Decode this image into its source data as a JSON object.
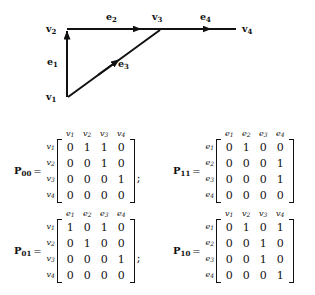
{
  "figure": {
    "name": "directed-graph",
    "nodes": [
      {
        "id": "v1",
        "label": "v",
        "sub": "1"
      },
      {
        "id": "v2",
        "label": "v",
        "sub": "2"
      },
      {
        "id": "v3",
        "label": "v",
        "sub": "3"
      },
      {
        "id": "v4",
        "label": "v",
        "sub": "4"
      }
    ],
    "edges": [
      {
        "id": "e1",
        "label": "e",
        "sub": "1",
        "from": "v1",
        "to": "v2"
      },
      {
        "id": "e2",
        "label": "e",
        "sub": "2",
        "from": "v2",
        "to": "v3"
      },
      {
        "id": "e3",
        "label": "e",
        "sub": "3",
        "from": "v1",
        "to": "v3"
      },
      {
        "id": "e4",
        "label": "e",
        "sub": "4",
        "from": "v3",
        "to": "v4"
      }
    ]
  },
  "matrices": [
    {
      "key": "P00",
      "name": "P",
      "sub": "00",
      "equals": "=",
      "trailing": ";",
      "col_headers": [
        {
          "base": "v",
          "sub": "1"
        },
        {
          "base": "v",
          "sub": "2"
        },
        {
          "base": "v",
          "sub": "3"
        },
        {
          "base": "v",
          "sub": "4"
        }
      ],
      "row_headers": [
        {
          "base": "v",
          "sub": "1"
        },
        {
          "base": "v",
          "sub": "2"
        },
        {
          "base": "v",
          "sub": "3"
        },
        {
          "base": "v",
          "sub": "4"
        }
      ],
      "rows": [
        [
          "0",
          "1",
          "1",
          "0"
        ],
        [
          "0",
          "0",
          "1",
          "0"
        ],
        [
          "0",
          "0",
          "0",
          "1"
        ],
        [
          "0",
          "0",
          "0",
          "0"
        ]
      ]
    },
    {
      "key": "P11",
      "name": "P",
      "sub": "11",
      "equals": "=",
      "trailing": "",
      "col_headers": [
        {
          "base": "e",
          "sub": "1"
        },
        {
          "base": "e",
          "sub": "2"
        },
        {
          "base": "e",
          "sub": "3"
        },
        {
          "base": "e",
          "sub": "4"
        }
      ],
      "row_headers": [
        {
          "base": "e",
          "sub": "1"
        },
        {
          "base": "e",
          "sub": "2"
        },
        {
          "base": "e",
          "sub": "3"
        },
        {
          "base": "e",
          "sub": "4"
        }
      ],
      "rows": [
        [
          "0",
          "1",
          "0",
          "0"
        ],
        [
          "0",
          "0",
          "0",
          "1"
        ],
        [
          "0",
          "0",
          "0",
          "1"
        ],
        [
          "0",
          "0",
          "0",
          "0"
        ]
      ]
    },
    {
      "key": "P01",
      "name": "P",
      "sub": "01",
      "equals": "=",
      "trailing": ";",
      "col_headers": [
        {
          "base": "e",
          "sub": "1"
        },
        {
          "base": "e",
          "sub": "2"
        },
        {
          "base": "e",
          "sub": "3"
        },
        {
          "base": "e",
          "sub": "4"
        }
      ],
      "row_headers": [
        {
          "base": "v",
          "sub": "1"
        },
        {
          "base": "v",
          "sub": "2"
        },
        {
          "base": "v",
          "sub": "3"
        },
        {
          "base": "v",
          "sub": "4"
        }
      ],
      "rows": [
        [
          "1",
          "0",
          "1",
          "0"
        ],
        [
          "0",
          "1",
          "0",
          "0"
        ],
        [
          "0",
          "0",
          "0",
          "1"
        ],
        [
          "0",
          "0",
          "0",
          "0"
        ]
      ]
    },
    {
      "key": "P10",
      "name": "P",
      "sub": "10",
      "equals": "=",
      "trailing": "",
      "col_headers": [
        {
          "base": "v",
          "sub": "1"
        },
        {
          "base": "v",
          "sub": "2"
        },
        {
          "base": "v",
          "sub": "3"
        },
        {
          "base": "v",
          "sub": "4"
        }
      ],
      "row_headers": [
        {
          "base": "e",
          "sub": "1"
        },
        {
          "base": "e",
          "sub": "2"
        },
        {
          "base": "e",
          "sub": "3"
        },
        {
          "base": "e",
          "sub": "4"
        }
      ],
      "rows": [
        [
          "0",
          "1",
          "0",
          "1"
        ],
        [
          "0",
          "0",
          "1",
          "0"
        ],
        [
          "0",
          "0",
          "1",
          "0"
        ],
        [
          "0",
          "0",
          "0",
          "1"
        ]
      ]
    }
  ],
  "colors": {
    "ink": "#111111",
    "background": "#ffffff"
  }
}
